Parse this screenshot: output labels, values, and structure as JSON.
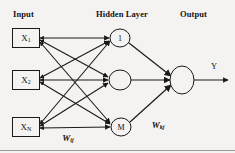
{
  "diagram": {
    "background_color": "#f4f3f1",
    "stroke_color": "#1a1a1a",
    "headers": {
      "input": "Input",
      "hidden": "Hidden Layer",
      "output": "Output"
    },
    "input_layer": {
      "nodes": [
        {
          "label": "X",
          "subscript": "1",
          "x": 26,
          "y": 38
        },
        {
          "label": "X",
          "subscript": "2",
          "x": 26,
          "y": 80
        },
        {
          "label": "X",
          "subscript": "N",
          "x": 26,
          "y": 127
        }
      ],
      "box_width": 27,
      "box_height": 19
    },
    "hidden_layer": {
      "nodes": [
        {
          "label": "1",
          "x": 120,
          "y": 38,
          "rx": 10,
          "ry": 9
        },
        {
          "label": "",
          "x": 120,
          "y": 80,
          "rx": 11,
          "ry": 10
        },
        {
          "label": "M",
          "x": 121,
          "y": 127,
          "rx": 10,
          "ry": 9
        }
      ]
    },
    "output_layer": {
      "nodes": [
        {
          "label": "",
          "x": 182,
          "y": 80,
          "rx": 12,
          "ry": 14
        }
      ],
      "signal_label": "Y",
      "signal_label_x": 214,
      "signal_label_y": 66,
      "arrow_end_x": 228,
      "arrow_end_y": 80
    },
    "weights": [
      {
        "label": "W",
        "subscript": "ij",
        "x": 68,
        "y": 138
      },
      {
        "label": "W",
        "subscript": "kj",
        "x": 158,
        "y": 125
      }
    ],
    "connections": {
      "input_to_hidden_count": 9,
      "hidden_to_output_count": 3,
      "arrowheads": "both-ends"
    }
  }
}
